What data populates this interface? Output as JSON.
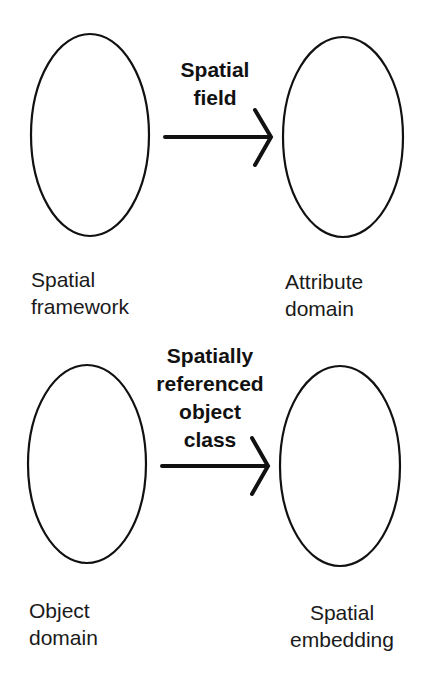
{
  "diagram": {
    "top": {
      "source": {
        "label_lines": [
          "Spatial",
          "framework"
        ]
      },
      "target": {
        "label_lines": [
          "Attribute",
          "domain"
        ]
      },
      "arrow": {
        "label_lines": [
          "Spatial",
          "field"
        ]
      }
    },
    "bottom": {
      "source": {
        "label_lines": [
          "Object",
          "domain"
        ]
      },
      "target": {
        "label_lines": [
          "Spatial",
          "embedding"
        ]
      },
      "arrow": {
        "label_lines": [
          "Spatially",
          "referenced",
          "object",
          "class"
        ]
      }
    }
  },
  "colors": {
    "stroke": "#111111",
    "background": "#ffffff"
  }
}
